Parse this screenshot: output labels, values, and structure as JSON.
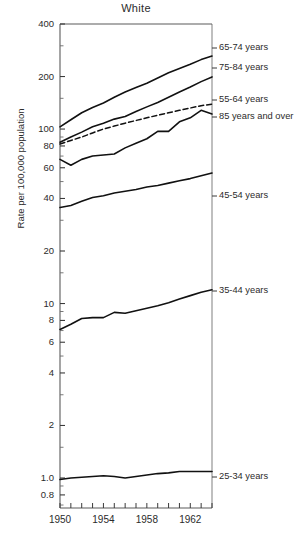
{
  "chart_data": {
    "type": "line",
    "title": "White",
    "xlabel": "",
    "ylabel": "Rate per 100,000 population",
    "yscale": "log",
    "ylim": [
      0.7,
      400
    ],
    "xlim": [
      1950,
      1964
    ],
    "grid": false,
    "legend_position": "right-of-plot",
    "x": [
      1950,
      1951,
      1952,
      1953,
      1954,
      1955,
      1956,
      1957,
      1958,
      1959,
      1960,
      1961,
      1962,
      1963,
      1964
    ],
    "y_ticks": [
      {
        "label": "400",
        "value": 400
      },
      {
        "label": "200",
        "value": 200
      },
      {
        "label": "100",
        "value": 100
      },
      {
        "label": "80",
        "value": 80
      },
      {
        "label": "60",
        "value": 60
      },
      {
        "label": "40",
        "value": 40
      },
      {
        "label": "20",
        "value": 20
      },
      {
        "label": "10",
        "value": 10
      },
      {
        "label": "8",
        "value": 8
      },
      {
        "label": "6",
        "value": 6
      },
      {
        "label": "4",
        "value": 4
      },
      {
        "label": "2",
        "value": 2
      },
      {
        "label": "1.0",
        "value": 1.0
      },
      {
        "label": "0.8",
        "value": 0.8
      }
    ],
    "x_ticks": [
      {
        "label": "1950",
        "value": 1950
      },
      {
        "label": "1954",
        "value": 1954
      },
      {
        "label": "1958",
        "value": 1958
      },
      {
        "label": "1962",
        "value": 1962
      }
    ],
    "x_minor_ticks": [
      1950,
      1951,
      1952,
      1953,
      1954,
      1955,
      1956,
      1957,
      1958,
      1959,
      1960,
      1961,
      1962,
      1963,
      1964
    ],
    "series": [
      {
        "name": "65-74 years",
        "label": "65-74 years",
        "style": "solid",
        "values": [
          103,
          113,
          124,
          133,
          141,
          152,
          163,
          173,
          183,
          196,
          210,
          222,
          235,
          250,
          262
        ]
      },
      {
        "name": "75-84 years",
        "label": "75-84 years",
        "style": "solid",
        "values": [
          84,
          90,
          96,
          103,
          108,
          114,
          118,
          126,
          134,
          142,
          152,
          163,
          174,
          187,
          199
        ]
      },
      {
        "name": "55-64 years",
        "label": "55-64  years",
        "style": "dashed",
        "values": [
          82,
          86,
          90,
          95,
          100,
          104,
          108,
          112,
          116,
          120,
          124,
          128,
          132,
          136,
          139
        ]
      },
      {
        "name": "85 years and over",
        "label": "85 years and over",
        "style": "solid",
        "values": [
          67,
          62,
          67,
          70,
          71,
          72,
          78,
          83,
          88,
          97,
          97,
          110,
          116,
          128,
          122
        ]
      },
      {
        "name": "45-54 years",
        "label": "45-54 years",
        "style": "solid",
        "values": [
          35.5,
          36.5,
          38.5,
          40.5,
          41.5,
          43,
          44,
          45,
          46.5,
          47.5,
          49,
          50.5,
          52,
          54,
          56
        ]
      },
      {
        "name": "35-44 years",
        "label": "35-44 years",
        "style": "solid",
        "values": [
          7.1,
          7.6,
          8.2,
          8.3,
          8.3,
          8.9,
          8.8,
          9.1,
          9.4,
          9.7,
          10.1,
          10.6,
          11.1,
          11.6,
          12.0
        ]
      },
      {
        "name": "25-34 years",
        "label": "25-34 years",
        "style": "solid",
        "values": [
          0.98,
          1.0,
          1.01,
          1.02,
          1.03,
          1.02,
          1.0,
          1.02,
          1.04,
          1.06,
          1.07,
          1.09,
          1.09,
          1.09,
          1.09
        ]
      }
    ]
  },
  "axis": {
    "y_label_text": "Rate per 100,000 population"
  }
}
